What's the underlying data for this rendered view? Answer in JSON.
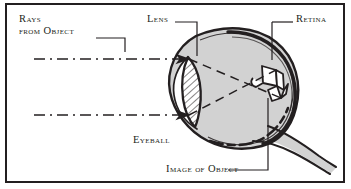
{
  "figure": {
    "kind": "anatomical-diagram",
    "frame_color": "#231f20",
    "background_color": "#ffffff",
    "eyeball_fill": "#d2d2d2",
    "ink_color": "#231f20",
    "labels": {
      "rays_line1": "Rays",
      "rays_line2": "from Object",
      "lens": "Lens",
      "retina": "Retina",
      "eyeball": "Eyeball",
      "image_of_object": "Image of Object"
    },
    "parts": [
      {
        "name": "lens",
        "description": "hatched lentil-shaped lens"
      },
      {
        "name": "retina",
        "description": "dark inner rear lining of eyeball"
      },
      {
        "name": "eyeball",
        "description": "gray-filled globe outline"
      },
      {
        "name": "optic-nerve",
        "description": "tapering stalk at lower right"
      },
      {
        "name": "image-of-object",
        "description": "inverted object sketch on retina"
      }
    ],
    "rays": [
      {
        "name": "upper-ray",
        "style": "dash-dot",
        "arrowhead": true
      },
      {
        "name": "lower-ray",
        "style": "dash-dot",
        "arrowhead": true
      },
      {
        "name": "upper-refracted-ray",
        "style": "dashed",
        "arrowhead": false
      },
      {
        "name": "lower-refracted-ray",
        "style": "dashed",
        "arrowhead": false
      }
    ]
  }
}
